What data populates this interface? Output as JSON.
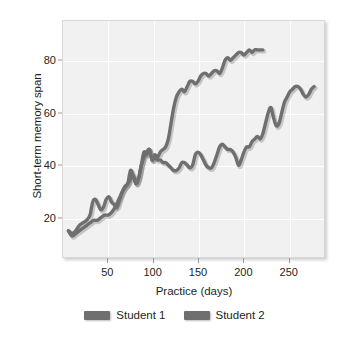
{
  "chart_data": {
    "type": "line",
    "title": "",
    "xlabel": "Practice (days)",
    "ylabel": "Short-term memory span",
    "xlim": [
      0,
      290
    ],
    "ylim": [
      5,
      95
    ],
    "xticks": [
      50,
      100,
      150,
      200,
      250
    ],
    "yticks": [
      20,
      40,
      60,
      80
    ],
    "grid": true,
    "legend_position": "bottom",
    "series": [
      {
        "name": "Student 1",
        "color": "#6f6f6f",
        "points": [
          [
            6,
            15
          ],
          [
            10,
            14
          ],
          [
            14,
            15
          ],
          [
            18,
            17
          ],
          [
            22,
            18
          ],
          [
            26,
            19
          ],
          [
            30,
            21
          ],
          [
            33,
            26
          ],
          [
            36,
            27
          ],
          [
            39,
            25
          ],
          [
            42,
            23
          ],
          [
            45,
            24
          ],
          [
            48,
            27
          ],
          [
            51,
            28
          ],
          [
            54,
            26
          ],
          [
            57,
            25
          ],
          [
            60,
            24
          ],
          [
            63,
            27
          ],
          [
            66,
            30
          ],
          [
            69,
            32
          ],
          [
            72,
            33
          ],
          [
            75,
            38
          ],
          [
            78,
            36
          ],
          [
            81,
            33
          ],
          [
            84,
            35
          ],
          [
            87,
            40
          ],
          [
            90,
            45
          ],
          [
            93,
            44
          ],
          [
            96,
            46
          ],
          [
            99,
            42
          ],
          [
            102,
            44
          ],
          [
            105,
            43
          ],
          [
            108,
            45
          ],
          [
            111,
            46
          ],
          [
            114,
            47
          ],
          [
            117,
            50
          ],
          [
            120,
            56
          ],
          [
            123,
            62
          ],
          [
            126,
            66
          ],
          [
            129,
            68
          ],
          [
            132,
            69
          ],
          [
            135,
            68
          ],
          [
            138,
            70
          ],
          [
            141,
            72
          ],
          [
            144,
            72
          ],
          [
            147,
            71
          ],
          [
            150,
            72
          ],
          [
            153,
            74
          ],
          [
            156,
            75
          ],
          [
            159,
            75
          ],
          [
            162,
            74
          ],
          [
            165,
            75
          ],
          [
            168,
            76
          ],
          [
            171,
            76
          ],
          [
            174,
            75
          ],
          [
            177,
            77
          ],
          [
            180,
            80
          ],
          [
            183,
            81
          ],
          [
            186,
            80
          ],
          [
            189,
            81
          ],
          [
            192,
            82
          ],
          [
            195,
            83
          ],
          [
            198,
            83
          ],
          [
            201,
            82
          ],
          [
            204,
            83
          ],
          [
            207,
            84
          ],
          [
            210,
            83
          ],
          [
            213,
            84
          ],
          [
            216,
            84
          ],
          [
            219,
            84
          ],
          [
            222,
            84
          ]
        ]
      },
      {
        "name": "Student 2",
        "color": "#6f6f6f",
        "points": [
          [
            6,
            15
          ],
          [
            10,
            13
          ],
          [
            14,
            14
          ],
          [
            18,
            15
          ],
          [
            22,
            16
          ],
          [
            26,
            17
          ],
          [
            30,
            18
          ],
          [
            34,
            19
          ],
          [
            38,
            19
          ],
          [
            42,
            20
          ],
          [
            46,
            21
          ],
          [
            50,
            21
          ],
          [
            54,
            22
          ],
          [
            58,
            24
          ],
          [
            62,
            27
          ],
          [
            66,
            30
          ],
          [
            70,
            32
          ],
          [
            74,
            34
          ],
          [
            78,
            36
          ],
          [
            81,
            33
          ],
          [
            84,
            35
          ],
          [
            87,
            40
          ],
          [
            90,
            43
          ],
          [
            93,
            45
          ],
          [
            96,
            46
          ],
          [
            99,
            42
          ],
          [
            102,
            43
          ],
          [
            105,
            42
          ],
          [
            108,
            42
          ],
          [
            111,
            41
          ],
          [
            114,
            41
          ],
          [
            117,
            40
          ],
          [
            120,
            39
          ],
          [
            123,
            38
          ],
          [
            126,
            38
          ],
          [
            129,
            39
          ],
          [
            132,
            41
          ],
          [
            135,
            41
          ],
          [
            138,
            40
          ],
          [
            141,
            39
          ],
          [
            144,
            40
          ],
          [
            147,
            44
          ],
          [
            150,
            45
          ],
          [
            153,
            44
          ],
          [
            156,
            42
          ],
          [
            159,
            40
          ],
          [
            162,
            39
          ],
          [
            165,
            39
          ],
          [
            168,
            41
          ],
          [
            171,
            44
          ],
          [
            174,
            47
          ],
          [
            177,
            48
          ],
          [
            180,
            47
          ],
          [
            183,
            46
          ],
          [
            186,
            46
          ],
          [
            189,
            45
          ],
          [
            192,
            43
          ],
          [
            195,
            40
          ],
          [
            198,
            42
          ],
          [
            201,
            45
          ],
          [
            204,
            47
          ],
          [
            207,
            47
          ],
          [
            210,
            49
          ],
          [
            213,
            50
          ],
          [
            216,
            51
          ],
          [
            219,
            50
          ],
          [
            222,
            52
          ],
          [
            225,
            56
          ],
          [
            228,
            60
          ],
          [
            231,
            62
          ],
          [
            234,
            58
          ],
          [
            237,
            55
          ],
          [
            240,
            56
          ],
          [
            243,
            60
          ],
          [
            246,
            64
          ],
          [
            249,
            66
          ],
          [
            252,
            68
          ],
          [
            255,
            69
          ],
          [
            258,
            70
          ],
          [
            261,
            70
          ],
          [
            264,
            69
          ],
          [
            267,
            67
          ],
          [
            270,
            66
          ],
          [
            273,
            67
          ],
          [
            276,
            69
          ],
          [
            279,
            70
          ]
        ]
      }
    ]
  },
  "legend": {
    "items": [
      {
        "label": "Student 1",
        "color": "#6f6f6f"
      },
      {
        "label": "Student 2",
        "color": "#6f6f6f"
      }
    ]
  }
}
